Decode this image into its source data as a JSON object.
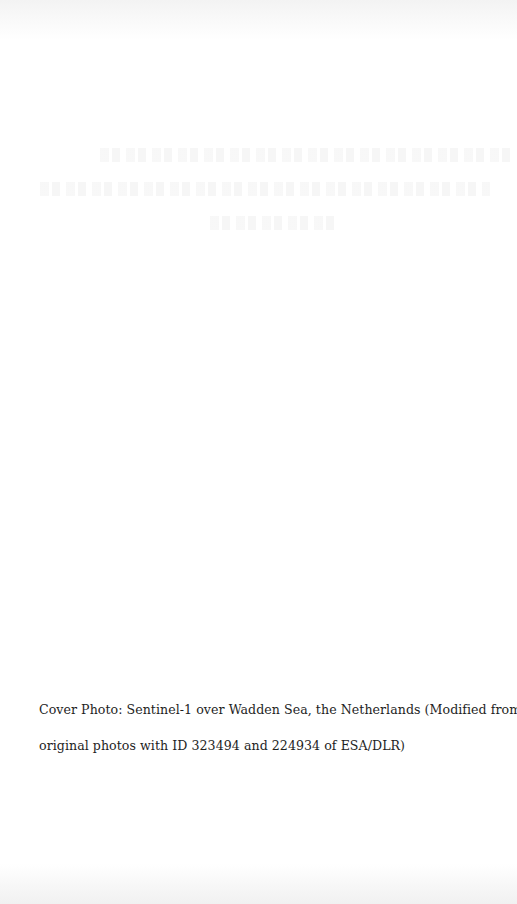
{
  "page": {
    "type": "cover-inside-page",
    "background_color": "#ffffff"
  },
  "title_block": {
    "note": "illegible faint title text (3 lines)",
    "line_count": 3
  },
  "caption": {
    "line1": "Cover Photo: Sentinel-1 over Wadden Sea, the Netherlands (Modified from two",
    "line2": "original photos with ID 323494 and 224934 of ESA/DLR)"
  }
}
